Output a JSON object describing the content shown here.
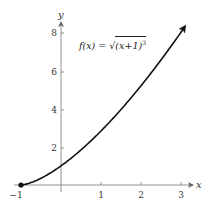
{
  "chart_data": {
    "type": "line",
    "title": "",
    "xlabel": "x",
    "ylabel": "y",
    "xlim": [
      -1,
      3.2
    ],
    "ylim": [
      0,
      8.6
    ],
    "x_ticks": [
      -1,
      1,
      2,
      3
    ],
    "x_tick_labels": [
      "-1",
      "1",
      "2",
      "3"
    ],
    "y_ticks": [
      2,
      4,
      6,
      8
    ],
    "y_tick_labels": [
      "2",
      "4",
      "6",
      "8"
    ],
    "grid": false,
    "legend": null,
    "series": [
      {
        "name": "f(x) = √((x+1)^3)",
        "x": [
          -1,
          -0.5,
          0,
          0.5,
          1,
          1.5,
          2,
          2.5,
          3,
          3.1
        ],
        "values": [
          0,
          0.35,
          1,
          1.84,
          2.83,
          3.95,
          5.2,
          6.55,
          8,
          8.3
        ],
        "start_point": {
          "x": -1,
          "y": 0,
          "marker": "filled-circle"
        },
        "end": "arrow"
      }
    ],
    "annotations": [
      {
        "text": "f(x) = √((x+1)^3)",
        "x": 0.5,
        "y": 7.3
      }
    ]
  },
  "labels": {
    "x_axis": "x",
    "y_axis": "y",
    "formula_lhs": "f(x) = ",
    "formula_inner": "(x+1)",
    "formula_exp": "3",
    "formula_radical": "√",
    "x_ticks": [
      "−1",
      "1",
      "2",
      "3"
    ],
    "y_ticks": [
      "2",
      "4",
      "6",
      "8"
    ]
  },
  "colors": {
    "curve": "#111111",
    "axes": "#666666"
  }
}
